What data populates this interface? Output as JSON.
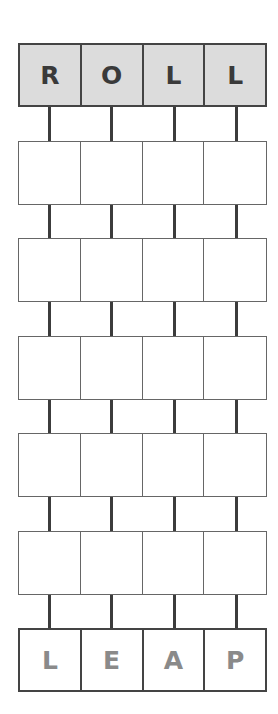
{
  "puzzle": {
    "type": "word-ladder",
    "start_word": [
      "R",
      "O",
      "L",
      "L"
    ],
    "end_word": [
      "L",
      "E",
      "A",
      "P"
    ],
    "blank_rows": 5,
    "colors": {
      "start_fill": "#dcdcdc",
      "start_text": "#3a3a3a",
      "end_text": "#8a8a8a",
      "border": "#444444"
    }
  }
}
